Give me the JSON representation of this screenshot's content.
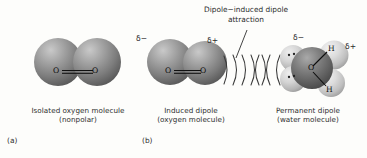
{
  "figure": {
    "background_color": "#fdfdfb",
    "top_annotation": {
      "line1": "Dipole−induced dipole",
      "line2": "attraction"
    }
  },
  "panels": [
    {
      "letter": "(a)",
      "caption_line1": "Isolated oxygen molecule",
      "caption_line2": "(nonpolar)",
      "molecule": {
        "name": "oxygen-molecule",
        "formula_left_atom": "O",
        "formula_right_atom": "O",
        "bond_type": "double",
        "charges": []
      }
    },
    {
      "letter": "(b)",
      "caption_line1": "Induced dipole",
      "caption_line2": "(oxygen molecule)",
      "molecule": {
        "name": "induced-dipole-oxygen-molecule",
        "formula_left_atom": "O",
        "formula_right_atom": "O",
        "bond_type": "double",
        "charges": [
          {
            "symbol": "δ−",
            "position": "upper-left"
          },
          {
            "symbol": "δ+",
            "position": "upper-right"
          }
        ]
      }
    },
    {
      "letter": "",
      "caption_line1": "Permanent dipole",
      "caption_line2": "(water molecule)",
      "molecule": {
        "name": "water-molecule",
        "central_atom": "O",
        "hydrogen_upper": "H",
        "hydrogen_lower": "H",
        "lone_pairs": 2,
        "charges": [
          {
            "symbol": "δ−",
            "position": "top"
          },
          {
            "symbol": "δ+",
            "position": "right"
          }
        ]
      }
    }
  ],
  "attraction_field": {
    "name": "dipole-induced-dipole-arcs",
    "arc_count": 7,
    "description": "nested curved arcs between the induced dipole and the permanent dipole"
  },
  "colors": {
    "oxygen_sphere": "#8d8d8d",
    "oxygen_sphere_dark": "#5d5d5d",
    "hydrogen_sphere": "#d3d3d3",
    "text": "#2b2b2b",
    "bond_line": "#111111"
  }
}
